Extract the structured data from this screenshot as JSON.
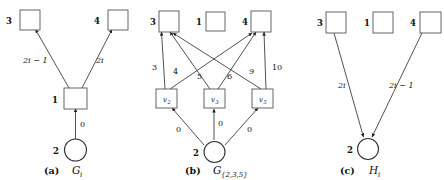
{
  "figure": {
    "panels": [
      {
        "id": "a",
        "caption_tag": "(a)",
        "caption_symbol": "G",
        "caption_subscript": "i",
        "nodes": [
          {
            "key": "n3",
            "id_label": "3",
            "shape": "square",
            "inner": ""
          },
          {
            "key": "n4",
            "id_label": "4",
            "shape": "square",
            "inner": ""
          },
          {
            "key": "n1",
            "id_label": "1",
            "shape": "square",
            "inner": ""
          },
          {
            "key": "n2",
            "id_label": "2",
            "shape": "circle",
            "inner": ""
          }
        ],
        "edges": [
          {
            "from": "n1",
            "to": "n3",
            "label": "2i − 1",
            "italic": true
          },
          {
            "from": "n1",
            "to": "n4",
            "label": "2i",
            "italic": true
          },
          {
            "from": "n2",
            "to": "n1",
            "label": "0",
            "italic": false
          }
        ]
      },
      {
        "id": "b",
        "caption_tag": "(b)",
        "caption_symbol": "G",
        "caption_subscript": "{2,3,5}",
        "nodes": [
          {
            "key": "n3",
            "id_label": "3",
            "shape": "square",
            "inner": ""
          },
          {
            "key": "n1",
            "id_label": "1",
            "shape": "square",
            "inner": ""
          },
          {
            "key": "n4",
            "id_label": "4",
            "shape": "square",
            "inner": ""
          },
          {
            "key": "v2",
            "id_label": "",
            "shape": "square",
            "inner": "v",
            "inner_sub": "2"
          },
          {
            "key": "v3",
            "id_label": "",
            "shape": "square",
            "inner": "v",
            "inner_sub": "3"
          },
          {
            "key": "v5",
            "id_label": "",
            "shape": "square",
            "inner": "v",
            "inner_sub": "5"
          },
          {
            "key": "n2",
            "id_label": "2",
            "shape": "circle",
            "inner": ""
          }
        ],
        "edges": [
          {
            "from": "v2",
            "to": "n3",
            "label": "3",
            "italic": false
          },
          {
            "from": "v3",
            "to": "n3",
            "label": "4",
            "italic": false
          },
          {
            "from": "v5",
            "to": "n3",
            "label": "5",
            "italic": false
          },
          {
            "from": "v2",
            "to": "n4",
            "label": "6",
            "italic": false
          },
          {
            "from": "v3",
            "to": "n4",
            "label": "9",
            "italic": false
          },
          {
            "from": "v5",
            "to": "n4",
            "label": "10",
            "italic": false
          },
          {
            "from": "n2",
            "to": "v2",
            "label": "0",
            "italic": false
          },
          {
            "from": "n2",
            "to": "v3",
            "label": "0",
            "italic": false
          },
          {
            "from": "n2",
            "to": "v5",
            "label": "0",
            "italic": false
          }
        ]
      },
      {
        "id": "c",
        "caption_tag": "(c)",
        "caption_symbol": "H",
        "caption_subscript": "i",
        "nodes": [
          {
            "key": "n3",
            "id_label": "3",
            "shape": "square",
            "inner": ""
          },
          {
            "key": "n1",
            "id_label": "1",
            "shape": "square",
            "inner": ""
          },
          {
            "key": "n4",
            "id_label": "4",
            "shape": "square",
            "inner": ""
          },
          {
            "key": "n2",
            "id_label": "2",
            "shape": "circle",
            "inner": ""
          }
        ],
        "edges": [
          {
            "from": "n3",
            "to": "n2",
            "label": "2i",
            "italic": true
          },
          {
            "from": "n4",
            "to": "n2",
            "label": "2i − 1",
            "italic": true
          }
        ]
      }
    ]
  }
}
